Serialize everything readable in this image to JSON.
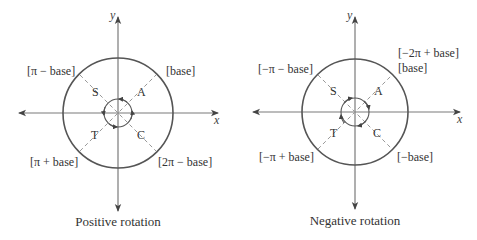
{
  "colors": {
    "axis": "#7a7a7a",
    "circle": "#555555",
    "dashed": "#999999",
    "text": "#333333"
  },
  "left": {
    "caption": "Positive rotation",
    "x_label": "x",
    "y_label": "y",
    "quadrants": {
      "q1": "A",
      "q2": "S",
      "q3": "T",
      "q4": "C"
    },
    "angle_labels": {
      "q1": "[base]",
      "q2": "[π − base]",
      "q3": "[π + base]",
      "q4": "[2π − base]"
    },
    "rotation_direction": "counterclockwise"
  },
  "right": {
    "caption": "Negative rotation",
    "x_label": "x",
    "y_label": "y",
    "quadrants": {
      "q1": "A",
      "q2": "S",
      "q3": "T",
      "q4": "C"
    },
    "angle_labels": {
      "q1_top": "[−2π + base]",
      "q1": "[base]",
      "q2": "[−π − base]",
      "q3": "[−π + base]",
      "q4": "[−base]"
    },
    "rotation_direction": "clockwise"
  }
}
